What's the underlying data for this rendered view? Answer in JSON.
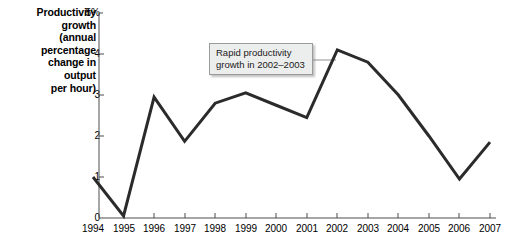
{
  "chart_data": {
    "type": "line",
    "title": "",
    "ylabel": "Productivity growth (annual percentage change in output per hour)",
    "xlabel": "",
    "categories": [
      "1994",
      "1995",
      "1996",
      "1997",
      "1998",
      "1999",
      "2000",
      "2001",
      "2002",
      "2003",
      "2004",
      "2005",
      "2006",
      "2007"
    ],
    "values": [
      1.0,
      0.05,
      2.95,
      1.87,
      2.8,
      3.05,
      2.75,
      2.45,
      4.1,
      3.8,
      3.0,
      2.0,
      0.95,
      1.85
    ],
    "series": [
      {
        "name": "Productivity growth",
        "values": [
          1.0,
          0.05,
          2.95,
          1.87,
          2.8,
          3.05,
          2.75,
          2.45,
          4.1,
          3.8,
          3.0,
          2.0,
          0.95,
          1.85
        ]
      }
    ],
    "ylim": [
      0,
      5
    ],
    "xlim": [
      "1994",
      "2007"
    ],
    "grid": false,
    "legend": false,
    "line_color": "#2b2b2b",
    "annotations": [
      {
        "text_line1": "Rapid productivity",
        "text_line2": "growth in 2002–2003",
        "points_to": "2002"
      }
    ]
  },
  "y_axis": {
    "title_lines": [
      "Productivity",
      "growth",
      "(annual",
      "percentage",
      "change in",
      "output",
      "per hour)"
    ],
    "ticks": [
      {
        "value": 5,
        "label": "5%"
      },
      {
        "value": 4,
        "label": "4"
      },
      {
        "value": 3,
        "label": "3"
      },
      {
        "value": 2,
        "label": "2"
      },
      {
        "value": 1,
        "label": "1"
      },
      {
        "value": 0,
        "label": "0"
      }
    ]
  },
  "x_axis": {
    "ticks": [
      {
        "label": "1994"
      },
      {
        "label": "1995"
      },
      {
        "label": "1996"
      },
      {
        "label": "1997"
      },
      {
        "label": "1998"
      },
      {
        "label": "1999"
      },
      {
        "label": "2000"
      },
      {
        "label": "2001"
      },
      {
        "label": "2002"
      },
      {
        "label": "2003"
      },
      {
        "label": "2004"
      },
      {
        "label": "2005"
      },
      {
        "label": "2006"
      },
      {
        "label": "2007"
      }
    ]
  },
  "annotation": {
    "line1": "Rapid productivity",
    "line2": "growth in 2002–2003"
  },
  "colors": {
    "line": "#2b2b2b",
    "axis": "#4d4d4d",
    "annotation_fill": "#eceded",
    "annotation_border": "#9a9a9a",
    "text": "#000000",
    "background": "#ffffff"
  }
}
